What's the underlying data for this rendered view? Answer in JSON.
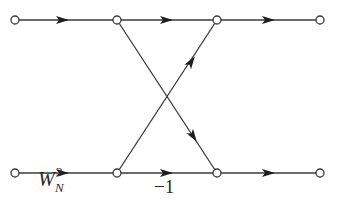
{
  "diagram": {
    "type": "signal-flow-graph",
    "nodes": [
      {
        "id": "in_top",
        "x": 15,
        "y": 20
      },
      {
        "id": "mid1_top",
        "x": 117,
        "y": 20
      },
      {
        "id": "mid2_top",
        "x": 217,
        "y": 20
      },
      {
        "id": "out_top",
        "x": 320,
        "y": 20
      },
      {
        "id": "in_bot",
        "x": 15,
        "y": 173
      },
      {
        "id": "mid1_bot",
        "x": 117,
        "y": 173
      },
      {
        "id": "mid2_bot",
        "x": 217,
        "y": 173
      },
      {
        "id": "out_bot",
        "x": 320,
        "y": 173
      }
    ],
    "edges": [
      {
        "from": "in_top",
        "to": "mid1_top",
        "label": ""
      },
      {
        "from": "mid1_top",
        "to": "mid2_top",
        "label": ""
      },
      {
        "from": "mid2_top",
        "to": "out_top",
        "label": ""
      },
      {
        "from": "in_bot",
        "to": "mid1_bot",
        "label": "W_N^3"
      },
      {
        "from": "mid1_bot",
        "to": "mid2_bot",
        "label": "-1"
      },
      {
        "from": "mid2_bot",
        "to": "out_bot",
        "label": ""
      },
      {
        "from": "mid1_top",
        "to": "mid2_bot",
        "label": ""
      },
      {
        "from": "mid1_bot",
        "to": "mid2_top",
        "label": ""
      }
    ],
    "labels": {
      "twiddle_base": "W",
      "twiddle_sup": "3",
      "twiddle_sub": "N",
      "minus_one": "−1"
    }
  }
}
